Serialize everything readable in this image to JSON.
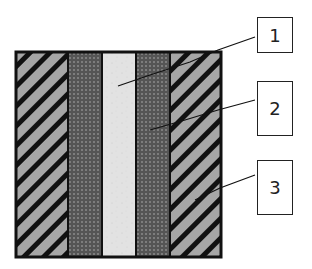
{
  "diagram": {
    "type": "layered-cross-section",
    "colors": {
      "outline": "#111111",
      "hatch_fill": "#a6a6a6",
      "hatch_stripe": "#111111",
      "dotted_fill": "#555555",
      "dotted_dot": "#8a8a8a",
      "core_fill": "#e2e2e2"
    },
    "layers": [
      {
        "position": "outer-left",
        "pattern": "diagonal-hatch",
        "callout": "3"
      },
      {
        "position": "inner-left",
        "pattern": "dotted",
        "callout": "2"
      },
      {
        "position": "center",
        "pattern": "light-speckled",
        "callout": "1"
      },
      {
        "position": "inner-right",
        "pattern": "dotted",
        "callout": "2"
      },
      {
        "position": "outer-right",
        "pattern": "diagonal-hatch",
        "callout": "3"
      }
    ],
    "callouts": [
      {
        "label": "1"
      },
      {
        "label": "2"
      },
      {
        "label": "3"
      }
    ]
  }
}
